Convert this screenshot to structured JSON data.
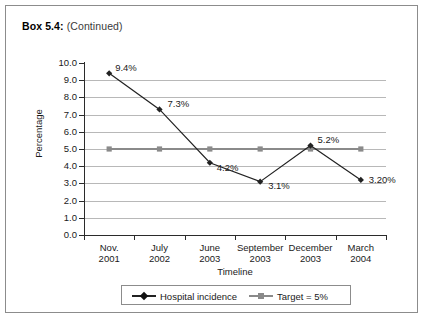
{
  "box": {
    "label": "Box 5.4:",
    "continued": "(Continued)"
  },
  "chart_data": {
    "type": "line",
    "title": "",
    "xlabel": "Timeline",
    "ylabel": "Percentage",
    "ylim": [
      0.0,
      10.0
    ],
    "ytick_labels": [
      "10.0",
      "9.0",
      "8.0",
      "7.0",
      "6.0",
      "5.0",
      "4.0",
      "3.0",
      "2.0",
      "1.0",
      "0.0"
    ],
    "ytick_values": [
      10.0,
      9.0,
      8.0,
      7.0,
      6.0,
      5.0,
      4.0,
      3.0,
      2.0,
      1.0,
      0.0
    ],
    "grid": true,
    "legend_position": "bottom",
    "categories": [
      {
        "line1": "Nov.",
        "line2": "2001"
      },
      {
        "line1": "July",
        "line2": "2002"
      },
      {
        "line1": "June",
        "line2": "2003"
      },
      {
        "line1": "September",
        "line2": "2003"
      },
      {
        "line1": "December",
        "line2": "2003"
      },
      {
        "line1": "March",
        "line2": "2004"
      }
    ],
    "series": [
      {
        "name": "Hospital incidence",
        "color": "#222222",
        "marker": "diamond",
        "values": [
          9.4,
          7.3,
          4.2,
          3.1,
          5.2,
          3.2
        ],
        "point_labels": [
          "9.4%",
          "7.3%",
          "4.2%",
          "3.1%",
          "5.2%",
          "3.20%"
        ]
      },
      {
        "name": "Target = 5%",
        "color": "#8a8a8a",
        "marker": "square",
        "values": [
          5.0,
          5.0,
          5.0,
          5.0,
          5.0,
          5.0
        ],
        "point_labels": [
          "",
          "",
          "",
          "",
          "",
          ""
        ]
      }
    ]
  }
}
